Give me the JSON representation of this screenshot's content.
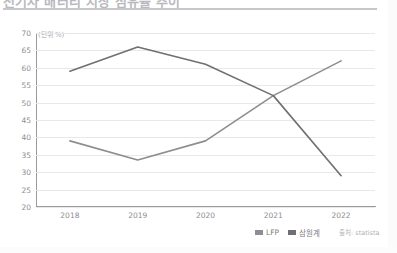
{
  "header": {
    "title": "전기차 배터리 시장 점유율 추이",
    "clipped": true
  },
  "chart_data": {
    "type": "line",
    "title": "전기차 배터리 시장 점유율 추이",
    "unit_label": "(단위 %)",
    "xlabel": "",
    "ylabel": "",
    "categories": [
      "2018",
      "2019",
      "2020",
      "2021",
      "2022"
    ],
    "ylim": [
      20,
      70
    ],
    "yticks": [
      "70",
      "65",
      "60",
      "55",
      "50",
      "45",
      "40",
      "35",
      "30",
      "25",
      "20"
    ],
    "ytick_values": [
      70,
      65,
      60,
      55,
      50,
      45,
      40,
      35,
      30,
      25,
      20
    ],
    "grid": true,
    "legend_position": "bottom-right",
    "series": [
      {
        "name": "LFP",
        "color": "#8d8d92",
        "values": [
          39,
          33.5,
          39,
          52,
          62
        ]
      },
      {
        "name": "삼원계",
        "color": "#6f6f74",
        "values": [
          59,
          66,
          61,
          52,
          29
        ]
      }
    ],
    "source": "출처: statista"
  },
  "legend": {
    "items": [
      {
        "label": "LFP",
        "color": "#8d8d92"
      },
      {
        "label": "삼원계",
        "color": "#6f6f74"
      }
    ]
  },
  "footer": {
    "source": "출처: statista"
  }
}
